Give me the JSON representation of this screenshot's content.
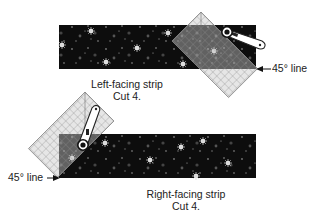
{
  "figure": {
    "top_panel": {
      "caption_line1": "Left-facing strip",
      "caption_line2": "Cut 4.",
      "marker_label": "45° line"
    },
    "bottom_panel": {
      "caption_line1": "Right-facing strip",
      "caption_line2": "Cut 4.",
      "marker_label": "45° line"
    }
  },
  "colors": {
    "fabric": "#0d0d0d",
    "ruler_grid": "#9a9a9a",
    "ruler_fill": "#bdbdbd",
    "text": "#222222"
  }
}
